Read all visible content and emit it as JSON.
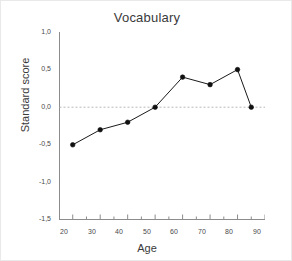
{
  "chart_data": {
    "type": "line",
    "title": "Vocabulary",
    "xlabel": "Age",
    "ylabel": "Standard score",
    "x": [
      20,
      30,
      40,
      50,
      60,
      70,
      80,
      85
    ],
    "values": [
      -0.5,
      -0.3,
      -0.2,
      0.0,
      0.4,
      0.3,
      0.5,
      0.0
    ],
    "series": [
      {
        "name": "Vocabulary",
        "x": [
          20,
          30,
          40,
          50,
          60,
          70,
          80,
          85
        ],
        "values": [
          -0.5,
          -0.3,
          -0.2,
          0.0,
          0.4,
          0.3,
          0.5,
          0.0
        ]
      }
    ],
    "xlim": [
      15,
      90
    ],
    "ylim": [
      -1.5,
      1.0
    ],
    "xticks": [
      20,
      30,
      40,
      50,
      60,
      70,
      80,
      90
    ],
    "xtick_labels": [
      "20",
      "30",
      "40",
      "50",
      "60",
      "70",
      "80",
      "90"
    ],
    "xminor_ticks": [
      25,
      35,
      45,
      55,
      65,
      75,
      85
    ],
    "yticks": [
      1.0,
      0.5,
      0.0,
      -0.5,
      -1.0,
      -1.5
    ],
    "ytick_labels": [
      "1,0",
      "0,5",
      "0,0",
      "-0,5",
      "-1,0",
      "-1,5"
    ],
    "yminor_ticks": [
      0.75,
      0.25,
      -0.25,
      -0.75,
      -1.25
    ],
    "grid": false,
    "reference_line": {
      "axis": "y",
      "value": 0.0,
      "style": "dashed",
      "color": "#b9b9b9"
    },
    "legend": null,
    "marker": "filled-circle",
    "line_color": "#1a1a1a",
    "marker_color": "#101010",
    "axis_color": "#8c8c8c",
    "background_color": "#ffffff"
  }
}
